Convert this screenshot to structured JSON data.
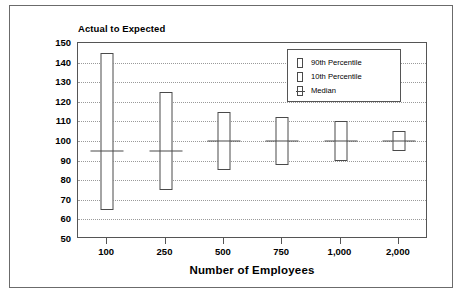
{
  "chart_data": {
    "type": "bar",
    "title": "Actual to Expected",
    "xlabel": "Number of Employees",
    "ylabel": "",
    "categories": [
      "100",
      "250",
      "500",
      "750",
      "1,000",
      "2,000"
    ],
    "ylim": [
      50,
      150
    ],
    "yticks": [
      150,
      140,
      130,
      120,
      110,
      100,
      90,
      80,
      70,
      60,
      50
    ],
    "grid": true,
    "legend_position": "top-right",
    "legend": [
      "90th Percentile",
      "10th Percentile",
      "Median"
    ],
    "series": [
      {
        "name": "90th Percentile",
        "values": [
          145,
          125,
          115,
          112,
          110,
          105
        ]
      },
      {
        "name": "10th Percentile",
        "values": [
          65,
          75,
          85,
          88,
          90,
          95
        ]
      },
      {
        "name": "Median",
        "values": [
          95,
          95,
          100,
          100,
          100,
          100
        ]
      }
    ]
  },
  "chart": {
    "title": "Actual to Expected",
    "xaxis_title": "Number of Employees"
  },
  "legend": {
    "items": [
      {
        "label": "90th Percentile",
        "marker": "box-marker"
      },
      {
        "label": "10th Percentile",
        "marker": "box-marker"
      },
      {
        "label": "Median",
        "marker": "box-median-marker"
      }
    ]
  }
}
